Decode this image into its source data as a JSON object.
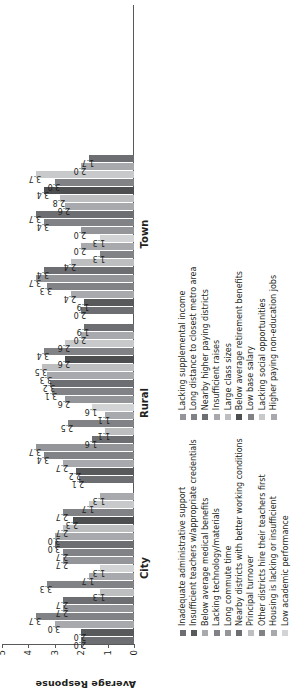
{
  "chart_data": {
    "type": "bar",
    "title": "",
    "xlabel": "",
    "ylabel": "Average Response",
    "ylim": [
      0,
      5
    ],
    "yticks": [
      "0",
      "1",
      "2",
      "3",
      "4",
      "5"
    ],
    "grid": false,
    "legend_position": "bottom",
    "categories": [
      "City",
      "Rural",
      "Town"
    ],
    "series": [
      {
        "name": "Inadequate administrative support",
        "color": "#6d6e71",
        "values": [
          2.0,
          2.1,
          2.0
        ]
      },
      {
        "name": "Insufficient teachers w/appropriate credentials",
        "color": "#58595b",
        "values": [
          2.0,
          2.2,
          1.9
        ]
      },
      {
        "name": "Below average medical benefits",
        "color": "#a7a9ac",
        "values": [
          3.0,
          2.7,
          2.4
        ]
      },
      {
        "name": "Lacking technology/materials",
        "color": "#808285",
        "values": [
          3.7,
          3.4,
          3.3
        ]
      },
      {
        "name": "Long commute time",
        "color": "#939598",
        "values": [
          2.7,
          3.7,
          3.7
        ]
      },
      {
        "name": "Nearby districts with better working conditions",
        "color": "#6d6e71",
        "values": [
          2.7,
          1.6,
          3.4
        ]
      },
      {
        "name": "Principal turnover",
        "color": "#bcbec0",
        "values": [
          1.3,
          1.1,
          2.4
        ]
      },
      {
        "name": "Other districts hire their teachers first",
        "color": "#808285",
        "values": [
          3.3,
          2.5,
          1.3
        ]
      },
      {
        "name": "Housing is lacking or insufficient",
        "color": "#a7a9ac",
        "values": [
          1.7,
          1.1,
          2.0
        ]
      },
      {
        "name": "Low academic performance",
        "color": "#d1d3d4",
        "values": [
          1.3,
          1.6,
          1.3
        ]
      },
      {
        "name": "Lacking supplemental income",
        "color": "#939598",
        "values": [
          2.7,
          2.6,
          2.0
        ]
      },
      {
        "name": "Long distance to closest metro area",
        "color": "#808285",
        "values": [
          2.7,
          3.1,
          3.4
        ]
      },
      {
        "name": "Nearby higher paying districts",
        "color": "#6d6e71",
        "values": [
          3.0,
          3.2,
          3.7
        ]
      },
      {
        "name": "Insufficient raises",
        "color": "#a7a9ac",
        "values": [
          3.0,
          3.3,
          2.6
        ]
      },
      {
        "name": "Large class sizes",
        "color": "#bcbec0",
        "values": [
          2.7,
          3.5,
          2.8
        ]
      },
      {
        "name": "Below average retirement benefits",
        "color": "#4d4e50",
        "values": [
          2.3,
          2.6,
          3.4
        ]
      },
      {
        "name": "Low base salary",
        "color": "#808285",
        "values": [
          2.7,
          3.4,
          3.0
        ]
      },
      {
        "name": "Lacking social opportunities",
        "color": "#c7c9cb",
        "values": [
          1.7,
          2.6,
          3.7
        ]
      },
      {
        "name": "Higher paying non-education jobs",
        "color": "#a7a9ac",
        "values": [
          1.3,
          2.0,
          2.0
        ]
      }
    ],
    "extra_bars": {
      "Rural": [
        {
          "label": "1.9",
          "value": 1.9,
          "color": "#6d6e71"
        }
      ],
      "Town": [
        {
          "label": "1.7",
          "value": 1.7,
          "color": "#6d6e71"
        }
      ]
    },
    "group_values": {
      "City": [
        "2.0",
        "2.0",
        "3.0",
        "3.7",
        "2.7",
        "2.7",
        "1.3",
        "3.3",
        "1.7",
        "1.3",
        "2.7",
        "2.7",
        "3.0",
        "3.0",
        "2.7",
        "2.3",
        "2.7",
        "1.7",
        "1.3"
      ],
      "Rural": [
        "2.1",
        "2.2",
        "2.7",
        "3.4",
        "3.7",
        "1.6",
        "1.1",
        "2.5",
        "1.1",
        "1.6",
        "2.6",
        "3.1",
        "3.2",
        "3.3",
        "3.5",
        "2.6",
        "3.4",
        "2.6",
        "2.0",
        "1.9"
      ],
      "Town": [
        "2.0",
        "1.9",
        "2.4",
        "3.3",
        "3.7",
        "3.4",
        "2.4",
        "1.3",
        "2.0",
        "1.3",
        "2.0",
        "3.4",
        "3.7",
        "2.6",
        "2.8",
        "3.4",
        "3.0",
        "3.7",
        "2.0",
        "1.7"
      ]
    }
  },
  "axis": {
    "ylabel": "Average Response",
    "ticks": [
      "5",
      "4",
      "3",
      "2",
      "1",
      "0"
    ]
  },
  "groups": [
    {
      "label": "City"
    },
    {
      "label": "Rural"
    },
    {
      "label": "Town"
    }
  ],
  "legend": {
    "column1": [
      "Inadequate administrative support",
      "Insufficient teachers w/appropriate credentials",
      "Below average medical benefits",
      "Lacking technology/materials",
      "Long commute time",
      "Nearby districts with better working conditions",
      "Principal turnover",
      "Other districts hire their teachers first",
      "Housing is lacking or insufficient",
      "Low academic performance"
    ],
    "column2": [
      "Lacking supplemental income",
      "Long distance to closest metro area",
      "Nearby higher paying districts",
      "Insufficient raises",
      "Large class sizes",
      "Below average retirement benefits",
      "Low base salary",
      "Lacking social opportunities",
      "Higher paying non-education jobs"
    ],
    "colors1": [
      "#6d6e71",
      "#58595b",
      "#a7a9ac",
      "#808285",
      "#939598",
      "#6d6e71",
      "#bcbec0",
      "#808285",
      "#a7a9ac",
      "#d1d3d4"
    ],
    "colors2": [
      "#939598",
      "#808285",
      "#6d6e71",
      "#a7a9ac",
      "#bcbec0",
      "#4d4e50",
      "#808285",
      "#c7c9cb",
      "#a7a9ac"
    ]
  }
}
